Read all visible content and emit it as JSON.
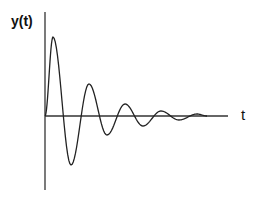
{
  "chart_data": {
    "type": "line",
    "title": "",
    "xlabel": "t",
    "ylabel": "y(t)",
    "grid": false,
    "legend": null,
    "series": [
      {
        "name": "y(t)",
        "points_px_extrema": [
          {
            "t_px": 45,
            "y_px": 116
          },
          {
            "t_px": 53,
            "y_px": 37
          },
          {
            "t_px": 71,
            "y_px": 165
          },
          {
            "t_px": 89,
            "y_px": 84
          },
          {
            "t_px": 107,
            "y_px": 135
          },
          {
            "t_px": 125,
            "y_px": 104
          },
          {
            "t_px": 143,
            "y_px": 126
          },
          {
            "t_px": 161,
            "y_px": 111
          },
          {
            "t_px": 179,
            "y_px": 120
          },
          {
            "t_px": 197,
            "y_px": 114
          },
          {
            "t_px": 207,
            "y_px": 116
          }
        ]
      }
    ],
    "axes": {
      "y_axis_x_px": 45,
      "y_axis_top_px": 12,
      "y_axis_bottom_px": 190,
      "t_axis_y_px": 116,
      "t_axis_left_px": 45,
      "t_axis_right_px": 228
    }
  },
  "labels": {
    "y_axis": "y(t)",
    "t_axis": "t"
  },
  "colors": {
    "line": "#222222",
    "axis": "#333333",
    "background": "#ffffff"
  }
}
